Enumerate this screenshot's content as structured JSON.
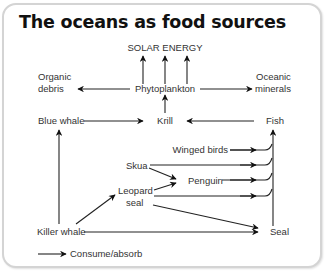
{
  "title": "The oceans as food sources",
  "nodes": {
    "solar_energy": "SOLAR ENERGY",
    "organic_debris_1": "Organic",
    "organic_debris_2": "debris",
    "phytoplankton": "Phytoplankton",
    "oceanic_minerals_1": "Oceanic",
    "oceanic_minerals_2": "minerals",
    "blue_whale": "Blue whale",
    "krill": "Krill",
    "fish": "Fish",
    "winged_birds": "Winged birds",
    "skua": "Skua",
    "penguin": "Penguin",
    "leopard_seal_1": "Leopard",
    "leopard_seal_2": "seal",
    "killer_whale": "Killer whale",
    "seal": "Seal"
  },
  "legend": {
    "label": "Consume/absorb"
  },
  "edges": [
    {
      "from": "Phytoplankton",
      "to": "SOLAR ENERGY"
    },
    {
      "from": "Phytoplankton",
      "to": "Organic debris"
    },
    {
      "from": "Phytoplankton",
      "to": "Oceanic minerals"
    },
    {
      "from": "Krill",
      "to": "Phytoplankton"
    },
    {
      "from": "Blue whale",
      "to": "Krill"
    },
    {
      "from": "Fish",
      "to": "Krill"
    },
    {
      "from": "Winged birds",
      "to": "Fish"
    },
    {
      "from": "Skua",
      "to": "Fish"
    },
    {
      "from": "Penguin",
      "to": "Fish"
    },
    {
      "from": "Leopard seal",
      "to": "Fish"
    },
    {
      "from": "Seal",
      "to": "Fish"
    },
    {
      "from": "Skua",
      "to": "Penguin"
    },
    {
      "from": "Leopard seal",
      "to": "Penguin"
    },
    {
      "from": "Killer whale",
      "to": "Leopard seal"
    },
    {
      "from": "Killer whale",
      "to": "Blue whale"
    },
    {
      "from": "Killer whale",
      "to": "Seal"
    },
    {
      "from": "Leopard seal",
      "to": "Seal"
    }
  ],
  "colors": {
    "line": "#222222",
    "text": "#333333",
    "frame": "#d4d4d4"
  }
}
